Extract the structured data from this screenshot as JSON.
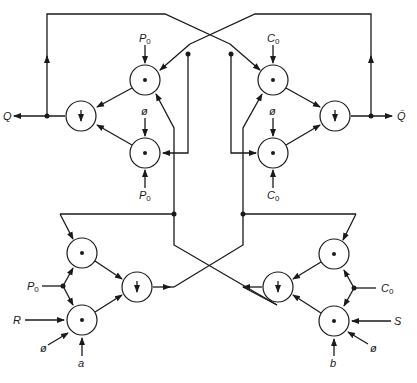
{
  "diagram": {
    "gate_symbols": {
      "and": "•",
      "nor": "↓"
    },
    "outputs": {
      "q": "Q",
      "q_bar": "Q̄"
    },
    "labels": {
      "p0": "P",
      "p0_sub": "0",
      "c0": "C",
      "c0_sub": "0",
      "phi": "ø",
      "r": "R",
      "s": "S",
      "a": "a",
      "b": "b"
    },
    "gates": [
      {
        "id": "top-left-and-upper",
        "type": "and",
        "cx": 145,
        "cy": 80
      },
      {
        "id": "top-left-and-lower",
        "type": "and",
        "cx": 145,
        "cy": 153
      },
      {
        "id": "top-left-nor",
        "type": "nor",
        "cx": 81,
        "cy": 116
      },
      {
        "id": "top-right-and-upper",
        "type": "and",
        "cx": 273,
        "cy": 80
      },
      {
        "id": "top-right-and-lower",
        "type": "and",
        "cx": 273,
        "cy": 153
      },
      {
        "id": "top-right-nor",
        "type": "nor",
        "cx": 335,
        "cy": 116
      },
      {
        "id": "bottom-left-and-upper",
        "type": "and",
        "cx": 82,
        "cy": 253
      },
      {
        "id": "bottom-left-and-lower",
        "type": "and",
        "cx": 82,
        "cy": 320
      },
      {
        "id": "bottom-left-nor",
        "type": "nor",
        "cx": 137,
        "cy": 287
      },
      {
        "id": "bottom-right-and-upper",
        "type": "and",
        "cx": 334,
        "cy": 254
      },
      {
        "id": "bottom-right-and-lower",
        "type": "and",
        "cx": 334,
        "cy": 321
      },
      {
        "id": "bottom-right-nor",
        "type": "nor",
        "cx": 278,
        "cy": 287
      }
    ]
  }
}
